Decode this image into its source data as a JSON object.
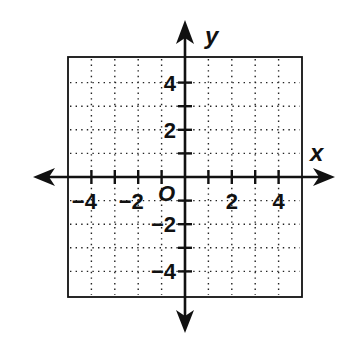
{
  "diagram": {
    "type": "coordinate-plane",
    "axes": {
      "x_label": "x",
      "y_label": "y",
      "origin_label": "O",
      "range": {
        "x": [
          -5,
          5
        ],
        "y": [
          -5,
          5
        ]
      },
      "arrows": true
    },
    "grid": {
      "style": "dotted",
      "step": 1,
      "on": true
    },
    "x_tick_labels": [
      {
        "value": -4,
        "text": "−4"
      },
      {
        "value": -2,
        "text": "−2"
      },
      {
        "value": 2,
        "text": "2"
      },
      {
        "value": 4,
        "text": "4"
      }
    ],
    "y_tick_labels": [
      {
        "value": 4,
        "text": "4"
      },
      {
        "value": 2,
        "text": "2"
      },
      {
        "value": -2,
        "text": "−2"
      },
      {
        "value": -4,
        "text": "−4"
      }
    ],
    "colors": {
      "ink": "#111111",
      "background": "#ffffff"
    }
  }
}
